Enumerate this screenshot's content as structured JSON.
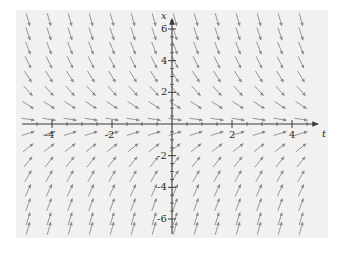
{
  "figure": {
    "background_color": "#ffffff",
    "panel_color": "#f2f1ef",
    "axis_color": "#3a3a3a",
    "arrow_color": "#8a8a93",
    "tick_text_color": "#2b2b2b"
  },
  "axes": {
    "x_axis_label": "t",
    "y_axis_label": "x",
    "x_ticks": [
      {
        "value": -4,
        "label": "-4"
      },
      {
        "value": -2,
        "label": "-2"
      },
      {
        "value": 2,
        "label": "2"
      },
      {
        "value": 4,
        "label": "4"
      }
    ],
    "y_ticks": [
      {
        "value": 6,
        "label": "6"
      },
      {
        "value": 4,
        "label": "4"
      },
      {
        "value": 2,
        "label": "2"
      },
      {
        "value": -2,
        "label": "-2"
      },
      {
        "value": -4,
        "label": "-4"
      },
      {
        "value": -6,
        "label": "-6"
      }
    ],
    "minor_x_ticks": [
      -4.5,
      -3.5,
      -3,
      -2.5,
      -1.5,
      -1,
      -0.5,
      0.5,
      1,
      1.5,
      2.5,
      3,
      3.5,
      4.5
    ],
    "minor_y_ticks": [
      6.5,
      5.5,
      5,
      4.5,
      3.5,
      3,
      2.5,
      1.5,
      1,
      0.5,
      -0.5,
      -1,
      -1.5,
      -2.5,
      -3,
      -3.5,
      -4.5,
      -5,
      -5.5,
      -6.5
    ]
  },
  "chart_data": {
    "type": "scatter",
    "title": "",
    "xlabel": "t",
    "ylabel": "x",
    "xlim": [
      -5.2,
      5.2
    ],
    "ylim": [
      -7.2,
      7.2
    ],
    "grid": false,
    "legend": "none",
    "plot_kind": "slope-field",
    "equation": "dx/dt = -x",
    "x_sample_points": [
      -4.8,
      -4.1,
      -3.4,
      -2.7,
      -2.0,
      -1.3,
      -0.6,
      0.1,
      0.8,
      1.5,
      2.2,
      2.9,
      3.6,
      4.3
    ],
    "y_sample_points": [
      6.6,
      5.7,
      4.8,
      3.9,
      3.0,
      2.1,
      1.2,
      0.3,
      -0.6,
      -1.5,
      -2.4,
      -3.3,
      -4.2,
      -5.1,
      -6.0,
      -6.6
    ],
    "annotations": []
  }
}
